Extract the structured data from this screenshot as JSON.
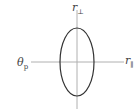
{
  "diagram": {
    "labels": {
      "top": {
        "main": "r",
        "sub": "⊥"
      },
      "left": {
        "main": "θ",
        "sub": "p"
      },
      "right": {
        "main": "r",
        "sub": "∥"
      }
    },
    "colors": {
      "axis": "#b0b0b0",
      "ellipse": "#333333",
      "text": "#444444"
    },
    "ellipse": {
      "cx": 77,
      "cy": 62,
      "rx": 17,
      "ry": 34
    }
  }
}
